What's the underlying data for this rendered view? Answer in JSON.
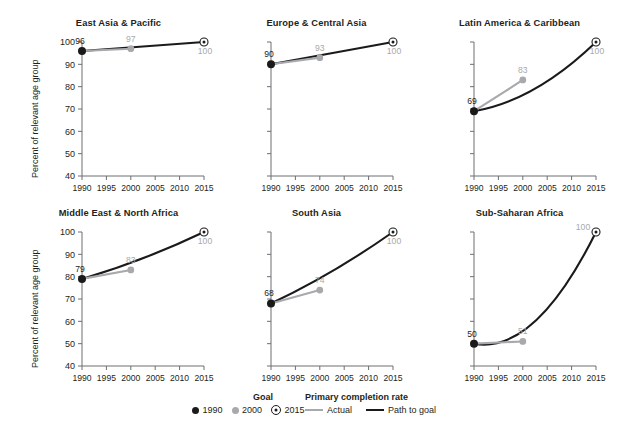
{
  "chart_data": {
    "type": "line",
    "title": "",
    "xlabel": "",
    "ylabel": "Percent of relevant age group",
    "xlim": [
      1990,
      2015
    ],
    "ylim": [
      40,
      100
    ],
    "x_ticks": [
      "1990",
      "1995",
      "2000",
      "2005",
      "2010",
      "2015"
    ],
    "y_ticks": [
      "40",
      "50",
      "60",
      "70",
      "80",
      "90",
      "100"
    ],
    "grid": false,
    "legend_position": "bottom-center",
    "series_names": [
      "Actual",
      "Path to goal"
    ],
    "marker_names": [
      "1990",
      "2000",
      "2015"
    ],
    "panels": [
      {
        "title": "East Asia & Pacific",
        "x": [
          1990,
          2000,
          2015
        ],
        "values": [
          96,
          97,
          100
        ],
        "labels": [
          "96",
          "97",
          "100"
        ],
        "actual_x": [
          1990,
          2000
        ],
        "actual_values": [
          96,
          97
        ],
        "path_x": [
          1990,
          2015
        ],
        "path_values": [
          96,
          100
        ],
        "path_curvature": 0.0
      },
      {
        "title": "Europe & Central Asia",
        "x": [
          1990,
          2000,
          2015
        ],
        "values": [
          90,
          93,
          100
        ],
        "labels": [
          "90",
          "93",
          "100"
        ],
        "actual_x": [
          1990,
          2000
        ],
        "actual_values": [
          90,
          93
        ],
        "path_x": [
          1990,
          2015
        ],
        "path_values": [
          90,
          100
        ],
        "path_curvature": 0.0
      },
      {
        "title": "Latin America & Caribbean",
        "x": [
          1990,
          2000,
          2015
        ],
        "values": [
          69,
          83,
          100
        ],
        "labels": [
          "69",
          "83",
          "100"
        ],
        "actual_x": [
          1990,
          2000
        ],
        "actual_values": [
          69,
          83
        ],
        "path_x": [
          1990,
          2015
        ],
        "path_values": [
          69,
          100
        ],
        "path_curvature": 0.35
      },
      {
        "title": "Middle East & North Africa",
        "x": [
          1990,
          2000,
          2015
        ],
        "values": [
          79,
          83,
          100
        ],
        "labels": [
          "79",
          "83",
          "100"
        ],
        "actual_x": [
          1990,
          2000
        ],
        "actual_values": [
          79,
          83
        ],
        "path_x": [
          1990,
          2015
        ],
        "path_values": [
          79,
          100
        ],
        "path_curvature": 0.12
      },
      {
        "title": "South Asia",
        "x": [
          1990,
          2000,
          2015
        ],
        "values": [
          68,
          74,
          100
        ],
        "labels": [
          "68",
          "74",
          "100"
        ],
        "actual_x": [
          1990,
          2000
        ],
        "actual_values": [
          68,
          74
        ],
        "path_x": [
          1990,
          2015
        ],
        "path_values": [
          68,
          100
        ],
        "path_curvature": 0.1
      },
      {
        "title": "Sub-Saharan Africa",
        "x": [
          1990,
          2000,
          2015
        ],
        "values": [
          50,
          51,
          100
        ],
        "labels": [
          "50",
          "51",
          "100"
        ],
        "actual_x": [
          1990,
          2000
        ],
        "actual_values": [
          50,
          51
        ],
        "path_x": [
          1990,
          2015
        ],
        "path_values": [
          50,
          100
        ],
        "path_curvature": 0.6
      }
    ]
  },
  "legend": {
    "goal_title": "Goal",
    "rate_title": "Primary completion rate",
    "goal_items": [
      {
        "label": "1990",
        "marker": "filled-black-dot"
      },
      {
        "label": "2000",
        "marker": "filled-gray-dot"
      },
      {
        "label": "2015",
        "marker": "target-circle"
      }
    ],
    "rate_items": [
      {
        "label": "Actual",
        "swatch": "gray-line",
        "color": "#a7a9ac"
      },
      {
        "label": "Path to goal",
        "swatch": "black-line",
        "color": "#1a1a1a"
      }
    ]
  },
  "colors": {
    "actual": "#a7a9ac",
    "path_to_goal": "#1a1a1a",
    "marker_1990": "#1a1a1a",
    "marker_2000": "#a7a9ac",
    "goal_marker": "#1a1a1a",
    "axis": "#6d6e71",
    "text": "#231f20",
    "background": "#ffffff"
  }
}
